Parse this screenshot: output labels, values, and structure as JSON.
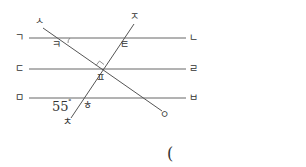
{
  "diagram": {
    "parallel_lines": [
      {
        "start_label": "ㄱ",
        "end_label": "ㄴ"
      },
      {
        "start_label": "ㄷ",
        "end_label": "ㄹ"
      },
      {
        "start_label": "ㅁ",
        "end_label": "ㅂ"
      }
    ],
    "transversals": [
      {
        "start_label": "ㅅ",
        "end_label": "ㅇ"
      },
      {
        "start_label": "ㅈ",
        "end_label": "ㅊ"
      }
    ],
    "angle_labels": {
      "k": "ㅋ",
      "t": "ㅌ",
      "p": "ㅍ",
      "h": "ㅎ"
    },
    "given_angle": {
      "value": "55",
      "unit": "°"
    },
    "right_angle_marker": true,
    "colors": {
      "line": "#555555",
      "text": "#333333"
    }
  },
  "answer": {
    "open_paren": "("
  }
}
